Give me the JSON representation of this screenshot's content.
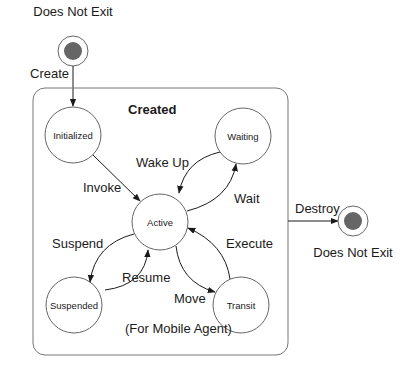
{
  "diagram": {
    "type": "state-machine",
    "container": {
      "label": "Created",
      "note": "(For Mobile Agent)"
    },
    "initial_state": {
      "label": "Does Not Exit"
    },
    "final_state": {
      "label": "Does Not Exit"
    },
    "states": [
      {
        "id": "initialized",
        "label": "Initialized"
      },
      {
        "id": "waiting",
        "label": "Waiting"
      },
      {
        "id": "active",
        "label": "Active"
      },
      {
        "id": "suspended",
        "label": "Suspended"
      },
      {
        "id": "transit",
        "label": "Transit"
      }
    ],
    "transitions": [
      {
        "from": "start",
        "to": "initialized",
        "label": "Create"
      },
      {
        "from": "initialized",
        "to": "active",
        "label": "Invoke"
      },
      {
        "from": "waiting",
        "to": "active",
        "label": "Wake Up"
      },
      {
        "from": "active",
        "to": "waiting",
        "label": "Wait"
      },
      {
        "from": "active",
        "to": "suspended",
        "label": "Suspend"
      },
      {
        "from": "suspended",
        "to": "active",
        "label": "Resume"
      },
      {
        "from": "active",
        "to": "transit",
        "label": "Move"
      },
      {
        "from": "transit",
        "to": "active",
        "label": "Execute"
      },
      {
        "from": "created",
        "to": "end",
        "label": "Destroy"
      }
    ],
    "colors": {
      "stroke": "#555555",
      "dot": "#666666",
      "text": "#1a1a1a"
    }
  }
}
